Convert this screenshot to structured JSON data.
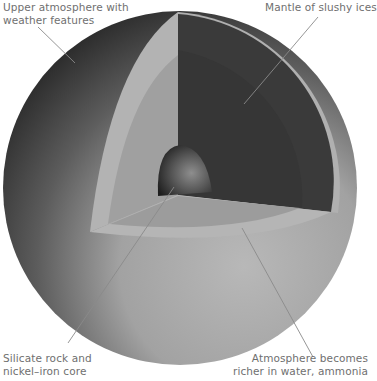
{
  "diagram": {
    "colors": {
      "background": "#ffffff",
      "atmosphere_dark": "#3c3c3c",
      "atmosphere_light": "#b4b4b4",
      "outer_band": "#b3b3b3",
      "inner_band": "#9a9a9a",
      "mantle": "#3a3a3a",
      "core": "#4a4a4a",
      "leader_line": "#8a8a8a",
      "label_text": "#6f6f6f"
    },
    "labels": {
      "upper_atmosphere": {
        "line1": "Upper atmosphere with",
        "line2": "weather features"
      },
      "mantle": {
        "line1": "Mantle of slushy ices"
      },
      "core": {
        "line1": "Silicate rock and",
        "line2": "nickel–iron core"
      },
      "atmosphere_deep": {
        "line1": "Atmosphere becomes",
        "line2": "richer in water, ammonia"
      }
    }
  }
}
